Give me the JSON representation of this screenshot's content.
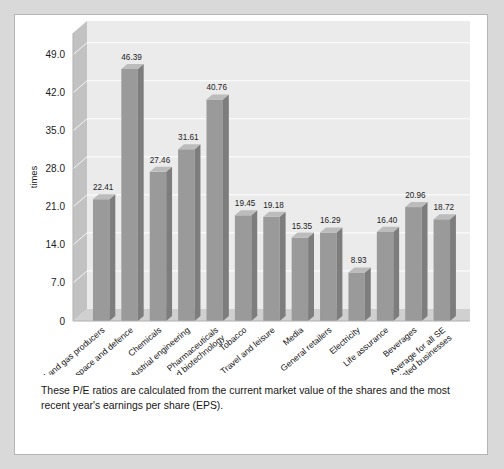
{
  "caption": {
    "text": "These P/E ratios are calculated from the current market value of the shares and the most recent year's earnings per share (EPS)."
  },
  "colors": {
    "page_background": "#d9d9d9",
    "panel_background": "#ffffff",
    "bar_front": "#9a9a9a",
    "bar_side": "#7d7d7d",
    "bar_top": "#bcbcbc",
    "back_wall": "#ebebeb",
    "side_wall": "#c2c2c2",
    "floor": "#d0d0d0",
    "gridline": "#ffffff",
    "text": "#1b1b1b"
  },
  "chart_data": {
    "type": "bar",
    "title": "",
    "subtitle": "",
    "xlabel": "",
    "ylabel": "times",
    "ylim": [
      0,
      53
    ],
    "yticks": [
      "0",
      "7.0",
      "14.0",
      "21.0",
      "28.0",
      "35.0",
      "42.0",
      "49.0"
    ],
    "ytick_values": [
      0,
      7,
      14,
      21,
      28,
      35,
      42,
      49
    ],
    "grid": true,
    "legend": "none",
    "three_d": true,
    "categories": [
      "Oil and gas producers",
      "Aerospace and defence",
      "Chemicals",
      "Industrial engineering",
      "Pharmaceuticals and biotechnology",
      "Tobacco",
      "Travel and leisure",
      "Media",
      "General retailers",
      "Electricity",
      "Life assurance",
      "Beverages",
      "Average for all SE listed businesses"
    ],
    "category_lines": [
      [
        "Oil and gas producers"
      ],
      [
        "Aerospace and defence"
      ],
      [
        "Chemicals"
      ],
      [
        "Industrial engineering"
      ],
      [
        "Pharmaceuticals",
        "and biotechnology"
      ],
      [
        "Tobacco"
      ],
      [
        "Travel and leisure"
      ],
      [
        "Media"
      ],
      [
        "General retailers"
      ],
      [
        "Electricity"
      ],
      [
        "Life assurance"
      ],
      [
        "Beverages"
      ],
      [
        "Average for all SE",
        "listed businesses"
      ]
    ],
    "values": [
      22.41,
      46.39,
      27.46,
      31.61,
      40.76,
      19.45,
      19.18,
      15.35,
      16.29,
      8.93,
      16.4,
      20.96,
      18.72
    ],
    "value_labels": [
      "22.41",
      "46.39",
      "27.46",
      "31.61",
      "40.76",
      "19.45",
      "19.18",
      "15.35",
      "16.29",
      "8.93",
      "16.40",
      "20.96",
      "18.72"
    ]
  }
}
